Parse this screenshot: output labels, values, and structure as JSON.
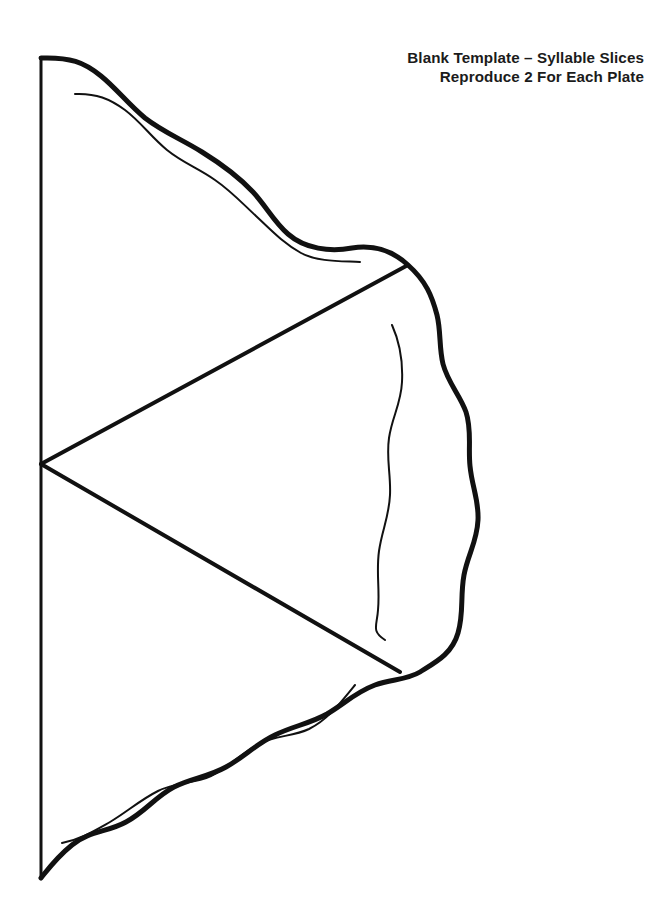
{
  "document": {
    "background_color": "#ffffff",
    "ink_color": "#111111",
    "page_width": 650,
    "page_height": 917
  },
  "title": {
    "line1": "Blank Template – Syllable Slices",
    "line2": "Reproduce 2 For Each Plate",
    "alignment": "right",
    "color": "#1b1b1b"
  },
  "artwork": {
    "name": "half-pie-template",
    "description": "Half circle pie template divided into three wedge slices with a wavy crust edge",
    "slice_count": 3,
    "stroke_colors": {
      "crust_outline": "#111111",
      "slice_divider": "#111111",
      "straight_cut_edge": "#111111",
      "inner_crust_line": "#111111"
    },
    "stroke_widths": {
      "crust_outline": 5.0,
      "slice_divider": 4.0,
      "straight_cut_edge": 3.0,
      "inner_crust_line": 2.0
    },
    "geometry": {
      "center_vertex": [
        41,
        464
      ],
      "cut_edge_top": [
        41,
        58
      ],
      "cut_edge_bottom": [
        41,
        878
      ],
      "rightmost_crust_x": 478,
      "divider_upper_end": [
        408,
        265
      ],
      "divider_lower_end": [
        400,
        672
      ]
    },
    "paths": {
      "straight_cut_edge": "M 41 58 L 41 878",
      "crust_outline": "M 41 58 C 70 57 84 62 101 76 C 117 89 128 104 145 118 C 163 132 181 139 202 152 C 223 165 238 176 253 192 C 266 206 274 222 288 234 C 305 249 330 252 352 248 C 372 245 392 250 408 265 C 426 281 432 296 437 315 C 441 331 439 348 443 364 C 448 383 460 395 466 412 C 472 430 468 447 470 466 C 472 487 479 500 478 520 C 477 542 468 554 464 575 C 460 597 464 613 458 633 C 452 654 436 662 420 672 C 407 680 391 679 375 685 C 356 692 344 704 327 714 C 309 724 293 726 275 735 C 256 744 244 757 226 767 C 208 777 192 778 174 787 C 155 797 145 812 126 822 C 108 832 89 831 72 845 C 57 857 49 868 41 878",
      "inner_line_upper": "M 75 94 C 96 93 110 99 125 110 C 141 122 151 137 167 150 C 183 163 198 168 215 180 C 231 191 242 203 256 216 C 271 230 283 243 301 253 C 318 262 341 261 360 262",
      "inner_line_middle": "M 392 325 C 401 345 403 362 402 382 C 401 404 392 417 389 438 C 386 459 391 474 390 495 C 389 517 382 530 379 551 C 376 573 380 589 378 610 C 377 626 371 631 385 640",
      "inner_line_lower": "M 62 843 C 81 839 94 831 110 822 C 127 812 140 800 158 791 C 176 782 193 784 211 776 C 230 767 241 753 259 744 C 276 735 292 737 309 729 C 327 720 338 706 355 685"
    }
  }
}
